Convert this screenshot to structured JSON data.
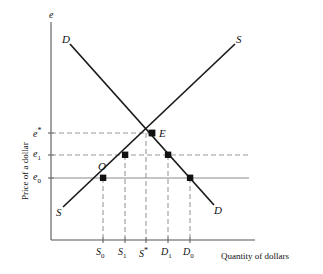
{
  "figure": {
    "axes": {
      "y_axis_top_symbol": "e",
      "y_axis_title": "Price of a dollar",
      "x_axis_title": "Quantity of dollars"
    },
    "y_ticks": [
      {
        "name": "e-star",
        "label_html": "e<sup>*</sup>",
        "value": "e*"
      },
      {
        "name": "e-one",
        "label_html": "e<sub>1</sub>",
        "value": "e1"
      },
      {
        "name": "e-zero",
        "label_html": "e<sub>0</sub>",
        "value": "e0"
      }
    ],
    "x_ticks": [
      {
        "name": "s-zero",
        "label_html": "S<sub>0</sub>",
        "value": "S0"
      },
      {
        "name": "s-one",
        "label_html": "S<sub>1</sub>",
        "value": "S1"
      },
      {
        "name": "s-star",
        "label_html": "S<sup>*</sup>",
        "value": "S*"
      },
      {
        "name": "d-one",
        "label_html": "D<sub>1</sub>",
        "value": "D1"
      },
      {
        "name": "d-zero",
        "label_html": "D<sub>0</sub>",
        "value": "D0"
      }
    ],
    "curve_labels": [
      {
        "name": "demand-curve-label-top-left",
        "text": "D"
      },
      {
        "name": "supply-curve-label-top-right",
        "text": "S"
      },
      {
        "name": "supply-curve-label-bottom-left",
        "text": "S"
      },
      {
        "name": "demand-curve-label-bottom-right",
        "text": "D"
      }
    ],
    "point_labels": [
      {
        "name": "equilibrium-point-label",
        "text": "E"
      },
      {
        "name": "observed-point-label",
        "text": "O"
      }
    ],
    "colors": {
      "curve": "#1a1a1a",
      "axis": "#555555",
      "guide_dashed": "#9a9a9a",
      "guide_solid": "#8a8a8a",
      "marker": "#111111",
      "text": "#111111",
      "background": "#ffffff"
    }
  },
  "chart_data": {
    "type": "line",
    "title": "",
    "xlabel": "Quantity of dollars",
    "ylabel": "Price of a dollar",
    "grid": false,
    "legend": "inline-curve-labels",
    "xlim": [
      0,
      100
    ],
    "ylim": [
      0,
      100
    ],
    "axis_tick_labels": {
      "x": [
        "S0",
        "S1",
        "S*",
        "D1",
        "D0"
      ],
      "y": [
        "e0",
        "e1",
        "e*"
      ]
    },
    "price_levels": {
      "e_star": 61,
      "e_1": 48,
      "e_0": 34
    },
    "quantity_levels": {
      "S0": 30,
      "S1": 42,
      "S_star": 53,
      "D1": 65,
      "D0": 77
    },
    "series": [
      {
        "name": "D",
        "label": "Demand for dollars",
        "type": "line",
        "points": [
          [
            10,
            92
          ],
          [
            92,
            15
          ]
        ]
      },
      {
        "name": "S",
        "label": "Supply of dollars",
        "type": "line",
        "points": [
          [
            18,
            13
          ],
          [
            98,
            92
          ]
        ]
      }
    ],
    "markers": [
      {
        "label": "E",
        "x": 53,
        "y": 61,
        "on": "S and D intersection"
      },
      {
        "label": "O",
        "x": 30,
        "y": 34,
        "on": "S"
      },
      {
        "label": "",
        "x": 42,
        "y": 48,
        "on": "S"
      },
      {
        "label": "",
        "x": 65,
        "y": 48,
        "on": "D"
      },
      {
        "label": "",
        "x": 77,
        "y": 34,
        "on": "D"
      }
    ],
    "annotations": [
      {
        "text": "e* dashed guide from axis to E",
        "style": "dashed"
      },
      {
        "text": "e1 dashed guide spanning S1 and D1",
        "style": "dashed"
      },
      {
        "text": "e0 solid guide spanning S0 and D0",
        "style": "solid"
      },
      {
        "text": "vertical dashed drops at S0, S1, S*, D1, D0",
        "style": "dashed"
      }
    ]
  }
}
